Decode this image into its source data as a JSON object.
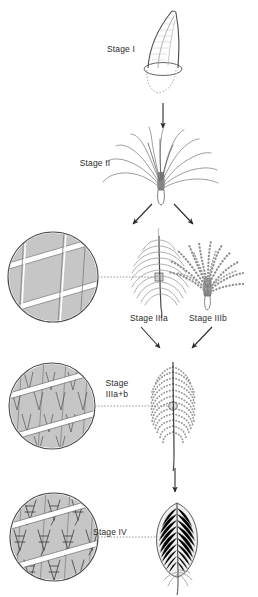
{
  "figure": {
    "background_color": "#ffffff",
    "ink_color": "#3a3a3a",
    "shade_color": "#c9c9c9",
    "width": 258,
    "height": 597
  },
  "stages": [
    {
      "id": "stage-1",
      "label": "Stage I",
      "label_x": 103,
      "label_y": 45,
      "structure": "undifferentiated tubular feather germ emerging from follicle",
      "has_detail_circle": false
    },
    {
      "id": "stage-2",
      "label": "Stage II",
      "label_x": 78,
      "label_y": 159,
      "structure": "tuft of unbranched barbs attached to a basal calamus",
      "has_detail_circle": false
    },
    {
      "id": "stage-3a",
      "label": "Stage IIIa",
      "label_x": 99,
      "label_y": 314,
      "structure": "planar feather with rachis and unbranched barbs",
      "has_detail_circle": true,
      "detail_caption": "smooth barb ridges without barbules"
    },
    {
      "id": "stage-3b",
      "label": "Stage IIIb",
      "label_x": 180,
      "label_y": 314,
      "structure": "tuft of barbs bearing barbules, no rachis",
      "has_detail_circle": false
    },
    {
      "id": "stage-3ab",
      "label": "Stage\nIIIa+b",
      "label_x": 100,
      "label_y": 379,
      "structure": "bipinnate open pennaceous feather with rachis, barbs and barbules",
      "has_detail_circle": true,
      "detail_caption": "barbs bearing simple unhooked barbules"
    },
    {
      "id": "stage-4",
      "label": "Stage IV",
      "label_x": 90,
      "label_y": 528,
      "structure": "closed pennaceous vane with interlocking hooked barbules",
      "has_detail_circle": true,
      "detail_caption": "barbules interlocked by hooklets forming a closed vane"
    }
  ],
  "arrows": [
    {
      "id": "arrow-1-to-2",
      "from": "stage-1",
      "to": "stage-2",
      "direction": "down"
    },
    {
      "id": "arrow-2-to-3a",
      "from": "stage-2",
      "to": "stage-3a",
      "direction": "down-left"
    },
    {
      "id": "arrow-2-to-3b",
      "from": "stage-2",
      "to": "stage-3b",
      "direction": "down-right"
    },
    {
      "id": "arrow-3a-to-3ab",
      "from": "stage-3a",
      "to": "stage-3ab",
      "direction": "down-right"
    },
    {
      "id": "arrow-3b-to-3ab",
      "from": "stage-3b",
      "to": "stage-3ab",
      "direction": "down-left"
    },
    {
      "id": "arrow-3ab-to-4",
      "from": "stage-3ab",
      "to": "stage-4",
      "direction": "down"
    }
  ],
  "detail_circles": [
    {
      "id": "detail-circle-3a",
      "cx": 53,
      "cy": 277,
      "r": 45,
      "leader_to_x": 158,
      "leader_to_y": 277
    },
    {
      "id": "detail-circle-3ab",
      "cx": 52,
      "cy": 406,
      "r": 43,
      "leader_to_x": 171,
      "leader_to_y": 406
    },
    {
      "id": "detail-circle-4",
      "cx": 54,
      "cy": 537,
      "r": 44,
      "leader_to_x": 176,
      "leader_to_y": 537
    }
  ]
}
